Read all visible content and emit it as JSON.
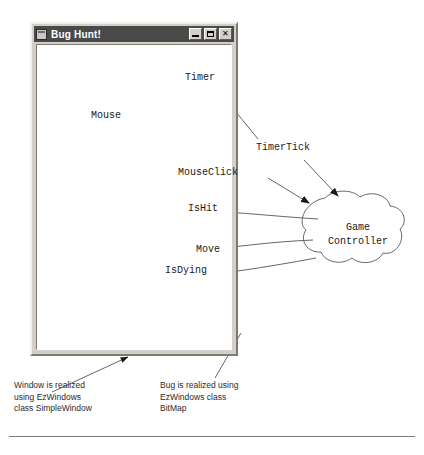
{
  "window": {
    "title": "Bug Hunt!",
    "icon": "window-icon",
    "buttons": [
      {
        "name": "minimize",
        "glyph": "_"
      },
      {
        "name": "maximize",
        "glyph": "□"
      },
      {
        "name": "close",
        "glyph": "✕"
      }
    ]
  },
  "objects": {
    "timer": "Timer",
    "mouse": "Mouse",
    "game_controller_line1": "Game",
    "game_controller_line2": "Controller",
    "bug_label": "C++"
  },
  "messages": {
    "timer_tick": "TimerTick",
    "mouse_click": "MouseClick",
    "is_hit": "IsHit",
    "move": "Move",
    "is_dying": "IsDying"
  },
  "notes": {
    "window_note": "Window is realized\nusing EzWindows\nclass SimpleWindow",
    "bug_note": "Bug is realized using\nEzWindows class\nBitMap"
  },
  "colors": {
    "window_frame": "#d4d0c8",
    "title_bar": "#4a4a4a",
    "client": "#ffffff",
    "ink": "#555555",
    "bug_body": "#111111"
  }
}
